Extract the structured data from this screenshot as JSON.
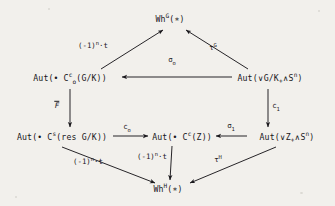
{
  "figure": {
    "kind": "commutative-diagram",
    "background_color": "#f2f0ec",
    "ink_color": "#17161a",
    "width": 335,
    "height": 206
  },
  "nodes": {
    "wh_g": {
      "id": "wh-g",
      "base": "Wh",
      "superscript": "G",
      "argument": "(∗)",
      "text": "Wh^G(∗)",
      "x": 170,
      "y": 19
    },
    "aut_c_o_c": {
      "id": "aut-c-o-c-gk",
      "prefix": "Aut(",
      "bullet": "•",
      "base": " C",
      "subscript": "o",
      "superscript": "c",
      "inner": "(G/K))",
      "text": "Aut(• C_o^c(G/K))",
      "x": 70,
      "y": 78
    },
    "aut_wedge_gk": {
      "id": "aut-wedge-gk-smash-sn",
      "prefix": "Aut(",
      "wedge": "∨",
      "inner": "G/K",
      "plus": "+",
      "smash": "∧",
      "sphere": "S",
      "superscript": "n",
      "suffix": ")",
      "text": "Aut(∨G/K₊∧S^n)",
      "x": 270,
      "y": 78
    },
    "aut_c_s_res": {
      "id": "aut-c-s-res-gk",
      "prefix": "Aut(",
      "bullet": "•",
      "base": " C",
      "superscript": "s",
      "inner": "(res G/K))",
      "text": "Aut(• C^s(res G/K))",
      "x": 62,
      "y": 137
    },
    "aut_c_c_z": {
      "id": "aut-c-c-z",
      "prefix": "Aut(",
      "bullet": "•",
      "base": " C",
      "superscript": "c",
      "inner": "(Z))",
      "text": "Aut(• C^c(Z))",
      "x": 182,
      "y": 137
    },
    "aut_wedge_z": {
      "id": "aut-wedge-z-smash-sn",
      "prefix": "Aut(",
      "wedge": "∨",
      "inner": "Z",
      "plus": "+",
      "smash": "∧",
      "sphere": "S",
      "superscript": "n",
      "suffix": ")",
      "text": "Aut(∨Z₊∧S^n)",
      "x": 287,
      "y": 137
    },
    "wh_h": {
      "id": "wh-h",
      "base": "Wh",
      "superscript": "H",
      "argument": "(∗)",
      "text": "Wh^H(∗)",
      "x": 168,
      "y": 189
    }
  },
  "arrows": [
    {
      "id": "arrow-aut-c-o-c-to-wh-g",
      "from": "aut_c_o_c",
      "to": "wh_g",
      "label": "(-1)^n·t",
      "label_base": "(-1)",
      "label_sup": "n",
      "label_tail": "·t",
      "label_x": 93,
      "label_y": 46,
      "style": "diagonal-up-right"
    },
    {
      "id": "arrow-aut-wedge-gk-to-wh-g",
      "from": "aut_wedge_gk",
      "to": "wh_g",
      "label": "τ^G",
      "label_base": "τ",
      "label_sup": "G",
      "label_tail": "",
      "label_x": 213,
      "label_y": 48,
      "style": "diagonal-up-left"
    },
    {
      "id": "arrow-sigma-o",
      "from": "aut_wedge_gk",
      "to": "aut_c_o_c",
      "label": "σ_o",
      "label_base": "σ",
      "label_sub": "o",
      "label_x": 172,
      "label_y": 60,
      "style": "horizontal-left"
    },
    {
      "id": "arrow-f-bar",
      "from": "aut_c_o_c",
      "to": "aut_c_s_res",
      "label": "F̅",
      "label_base": "F",
      "label_overbar": true,
      "label_x": 57,
      "label_y": 105,
      "style": "vertical-down"
    },
    {
      "id": "arrow-c-1",
      "from": "aut_wedge_gk",
      "to": "aut_wedge_z",
      "label": "c_1",
      "label_base": "c",
      "label_sub": "1",
      "label_x": 276,
      "label_y": 106,
      "style": "vertical-down"
    },
    {
      "id": "arrow-c-o",
      "from": "aut_c_s_res",
      "to": "aut_c_c_z",
      "label": "c_o",
      "label_base": "c",
      "label_sub": "o",
      "label_x": 127,
      "label_y": 127,
      "style": "horizontal-right"
    },
    {
      "id": "arrow-sigma-1",
      "from": "aut_wedge_z",
      "to": "aut_c_c_z",
      "label": "σ_1",
      "label_base": "σ",
      "label_sub": "1",
      "label_x": 231,
      "label_y": 126,
      "style": "horizontal-left"
    },
    {
      "id": "arrow-aut-c-s-res-to-wh-h",
      "from": "aut_c_s_res",
      "to": "wh_h",
      "label": "(-1)^n·t",
      "label_base": "(-1)",
      "label_sup": "n",
      "label_tail": "·t",
      "label_x": 88,
      "label_y": 162,
      "style": "diagonal-down-right"
    },
    {
      "id": "arrow-aut-c-c-z-to-wh-h",
      "from": "aut_c_c_z",
      "to": "wh_h",
      "label": "(-1)^n·t",
      "label_base": "(-1)",
      "label_sup": "n",
      "label_tail": "·t",
      "label_x": 152,
      "label_y": 157,
      "style": "vertical-down"
    },
    {
      "id": "arrow-aut-wedge-z-to-wh-h",
      "from": "aut_wedge_z",
      "to": "wh_h",
      "label": "τ^H",
      "label_base": "τ",
      "label_sup": "H",
      "label_tail": "",
      "label_x": 218,
      "label_y": 160,
      "style": "diagonal-down-left"
    }
  ]
}
